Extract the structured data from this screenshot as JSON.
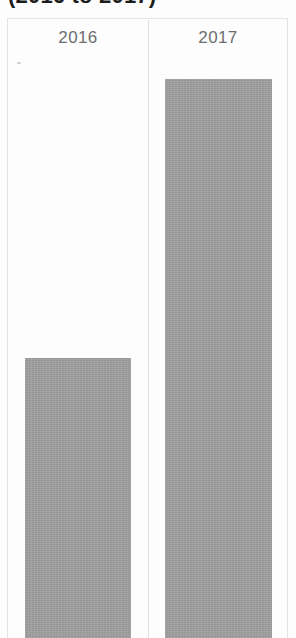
{
  "chart_data": {
    "type": "bar",
    "title": "(2016 to 2017)",
    "categories": [
      "2016",
      "2017"
    ],
    "values": [
      280,
      559
    ],
    "series": [
      {
        "name": "value",
        "values": [
          280,
          559
        ]
      }
    ],
    "xlabel": "",
    "ylabel": "",
    "ylim": [
      0,
      620
    ],
    "grid": false,
    "legend": "none",
    "bar_color": "#9d9d9d"
  },
  "chart": {
    "title": "(2016 to 2017)",
    "frame": {
      "divider_label": "category-divider"
    },
    "categories": [
      {
        "label": "2016"
      },
      {
        "label": "2017"
      }
    ]
  }
}
